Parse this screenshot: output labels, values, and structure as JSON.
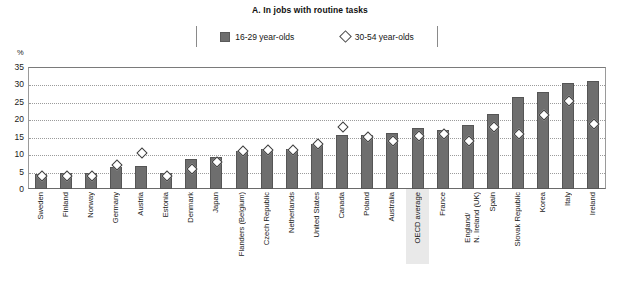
{
  "chart_data": {
    "type": "bar",
    "title": "A. In jobs with routine tasks",
    "xlabel": "",
    "ylabel": "%",
    "ylim": [
      0,
      35
    ],
    "yticks": [
      0,
      5,
      10,
      15,
      20,
      25,
      30,
      35
    ],
    "grid": true,
    "legend_position": "top-center",
    "highlight_category": "OECD average",
    "categories": [
      "Sweden",
      "Finland",
      "Norway",
      "Germany",
      "Austria",
      "Estonia",
      "Denmark",
      "Japan",
      "Flanders (Belgium)",
      "Czech Republic",
      "Netherlands",
      "United States",
      "Canada",
      "Poland",
      "Australia",
      "OECD average",
      "France",
      "England/\nN. Ireland (UK)",
      "Spain",
      "Slovak Republic",
      "Korea",
      "Italy",
      "Ireland"
    ],
    "series": [
      {
        "name": "16-29 year-olds",
        "type": "bar",
        "color": "#6e6e6e",
        "values": [
          4.3,
          4.5,
          4.5,
          6.2,
          6.5,
          4.5,
          8.5,
          9.3,
          11.0,
          11.5,
          11.5,
          13.0,
          15.5,
          15.5,
          16.0,
          17.5,
          17.0,
          18.5,
          21.5,
          26.5,
          27.8,
          30.5,
          31.0
        ]
      },
      {
        "name": "30-54 year-olds",
        "type": "scatter",
        "marker": "diamond-open",
        "color": "#ffffff",
        "edge_color": "#3d3d3d",
        "values": [
          3.5,
          3.5,
          3.5,
          6.5,
          10.0,
          3.5,
          5.5,
          7.5,
          10.5,
          11.0,
          11.0,
          12.5,
          17.5,
          14.5,
          13.5,
          15.0,
          15.5,
          13.5,
          17.5,
          15.5,
          21.0,
          25.0,
          18.5
        ]
      }
    ]
  },
  "legend": {
    "items": [
      {
        "label": "16-29 year-olds",
        "marker": "filled-square"
      },
      {
        "label": "30-54 year-olds",
        "marker": "open-diamond"
      }
    ]
  },
  "axis": {
    "unit": "%"
  },
  "colors": {
    "bar": "#6e6e6e",
    "bar_edge": "#555555",
    "diamond_edge": "#3d3d3d",
    "gridline": "#9b9b9b",
    "highlight_band": "#e9e9e9",
    "frame": "#7a7a7a"
  }
}
